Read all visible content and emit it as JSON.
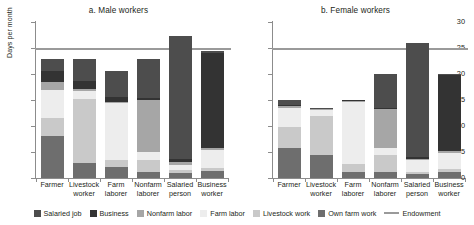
{
  "chart_data": {
    "type": "bar",
    "subtype": "stacked-bar",
    "title": "",
    "panels": [
      {
        "key": "male",
        "title": "a. Male workers",
        "ylabel": "Days per month",
        "xlabel": "",
        "ylim": [
          0,
          30
        ],
        "yticks": [
          0,
          5,
          10,
          15,
          20,
          25,
          30
        ],
        "grid": false,
        "categories": [
          "Farmer",
          "Livestock worker",
          "Farm laborer",
          "Nonfarm laborer",
          "Salaried person",
          "Business worker"
        ],
        "category_lines": [
          [
            "Farmer",
            ""
          ],
          [
            "Livestock",
            "worker"
          ],
          [
            "Farm",
            "laborer"
          ],
          [
            "Nonfarm",
            "laborer"
          ],
          [
            "Salaried",
            "person"
          ],
          [
            "Business",
            "worker"
          ]
        ],
        "series": [
          {
            "name": "Own farm work",
            "values": [
              8.0,
              2.9,
              2.2,
              1.2,
              1.0,
              1.3
            ]
          },
          {
            "name": "Livestock work",
            "values": [
              3.6,
              12.2,
              1.2,
              2.3,
              0.5,
              0.6
            ]
          },
          {
            "name": "Farm labor",
            "values": [
              5.3,
              1.6,
              11.0,
              1.5,
              1.0,
              3.5
            ]
          },
          {
            "name": "Nonfarm labor",
            "values": [
              1.6,
              0.4,
              0.3,
              10.0,
              0.6,
              0.4
            ]
          },
          {
            "name": "Business",
            "values": [
              2.0,
              1.5,
              0.9,
              0.4,
              0.5,
              18.2
            ]
          },
          {
            "name": "Salaried job",
            "values": [
              2.3,
              4.2,
              5.0,
              7.4,
              23.7,
              0.5
            ]
          }
        ],
        "totals": [
          22.8,
          22.8,
          20.6,
          22.8,
          27.3,
          24.5
        ],
        "endowment": 25
      },
      {
        "key": "female",
        "title": "b. Female workers",
        "ylabel": "Days per month",
        "xlabel": "",
        "ylim": [
          0,
          30
        ],
        "yticks": [
          0,
          5,
          10,
          15,
          20,
          25,
          30
        ],
        "grid": false,
        "categories": [
          "Farmer",
          "Livestock worker",
          "Farm laborer",
          "Nonfarm laborer",
          "Salaried person",
          "Business worker"
        ],
        "category_lines": [
          [
            "Farmer",
            ""
          ],
          [
            "Livestock",
            "worker"
          ],
          [
            "Farm",
            "laborer"
          ],
          [
            "Nonfarm",
            "laborer"
          ],
          [
            "Salaried",
            "person"
          ],
          [
            "Business",
            "worker"
          ]
        ],
        "series": [
          {
            "name": "Own farm work",
            "values": [
              5.8,
              4.4,
              1.2,
              1.2,
              0.7,
              1.1
            ]
          },
          {
            "name": "Livestock work",
            "values": [
              4.0,
              7.5,
              1.4,
              3.2,
              0.5,
              0.6
            ]
          },
          {
            "name": "Farm labor",
            "values": [
              3.7,
              1.2,
              12.1,
              1.3,
              2.2,
              3.2
            ]
          },
          {
            "name": "Nonfarm labor",
            "values": [
              0.3,
              0.1,
              0.2,
              7.6,
              0.3,
              0.3
            ]
          },
          {
            "name": "Business",
            "values": [
              0.2,
              0.1,
              0.1,
              0.2,
              0.3,
              14.6
            ]
          },
          {
            "name": "Salaried job",
            "values": [
              1.0,
              0.2,
              0.1,
              6.6,
              22.0,
              0.2
            ]
          }
        ],
        "totals": [
          15.0,
          13.5,
          15.1,
          20.1,
          26.0,
          20.0
        ],
        "endowment": 25
      }
    ],
    "legend": {
      "position": "bottom",
      "entries": [
        {
          "label": "Salaried job",
          "color": "#4d4d4d",
          "type": "swatch"
        },
        {
          "label": "Business",
          "color": "#333333",
          "type": "swatch"
        },
        {
          "label": "Nonfarm labor",
          "color": "#a6a6a6",
          "type": "swatch"
        },
        {
          "label": "Farm labor",
          "color": "#ededed",
          "type": "swatch"
        },
        {
          "label": "Livestock work",
          "color": "#c9c9c9",
          "type": "swatch"
        },
        {
          "label": "Own farm work",
          "color": "#6e6e6e",
          "type": "swatch"
        },
        {
          "label": "Endowment",
          "color": "#9a9a9a",
          "type": "line"
        }
      ]
    },
    "colors": {
      "salaried_job": "#4d4d4d",
      "business": "#333333",
      "nonfarm_labor": "#a6a6a6",
      "farm_labor": "#ededed",
      "livestock_work": "#c9c9c9",
      "own_farm_work": "#6e6e6e",
      "endowment": "#9a9a9a",
      "axis": "#8c8c8c",
      "text": "#231f20",
      "background": "#ffffff"
    }
  }
}
